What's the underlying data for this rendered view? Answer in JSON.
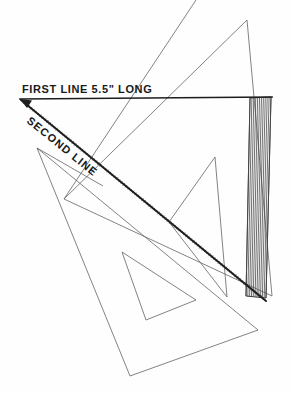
{
  "figure": {
    "medium": "scanned line drawing on white paper",
    "background_color": "#fefefe",
    "ink_color": "#1d1d1d",
    "thin_line_color": "#636363",
    "canvas": {
      "width": 291,
      "height": 393
    }
  },
  "labels": {
    "first_line": {
      "text": "FIRST LINE  5.5\" LONG",
      "x": 22,
      "y": 93,
      "rotation": 0,
      "font_size": 11,
      "letter_spacing": 0.6
    },
    "second_line": {
      "text": "SECOND LINE",
      "x": 26,
      "y": 122,
      "rotation": 39,
      "font_size": 11,
      "letter_spacing": 1.1
    }
  },
  "construction_lines": {
    "first_line": {
      "name": "first-line",
      "from": {
        "x": 20,
        "y": 99
      },
      "to": {
        "x": 272,
        "y": 97
      },
      "stroke_width": 1.7,
      "arrow_at": "start"
    },
    "second_line": {
      "name": "second-line",
      "from": {
        "x": 21,
        "y": 100
      },
      "to": {
        "x": 266,
        "y": 301
      },
      "stroke_width": 2.0,
      "style": "sketched"
    }
  },
  "upper_triangle": {
    "name": "upper-drafting-triangle",
    "outline": [
      {
        "x": 247,
        "y": 20
      },
      {
        "x": 272,
        "y": 296
      },
      {
        "x": 64,
        "y": 199
      }
    ],
    "inner_cutout": [
      {
        "x": 215,
        "y": 157
      },
      {
        "x": 227,
        "y": 297
      },
      {
        "x": 169,
        "y": 222
      }
    ],
    "stroke_width": 0.8
  },
  "lower_triangle": {
    "name": "lower-drafting-triangle",
    "outline": [
      {
        "x": 37,
        "y": 148
      },
      {
        "x": 258,
        "y": 330
      },
      {
        "x": 130,
        "y": 376
      }
    ],
    "inner_cutout": [
      {
        "x": 122,
        "y": 252
      },
      {
        "x": 196,
        "y": 300
      },
      {
        "x": 146,
        "y": 320
      }
    ],
    "stroke_width": 0.8
  },
  "hatched_strip": {
    "name": "section-hatched-strip",
    "description": "narrow vertical band filled with closely spaced hatch lines",
    "outline": [
      {
        "x": 250,
        "y": 98
      },
      {
        "x": 271,
        "y": 97
      },
      {
        "x": 266,
        "y": 298
      },
      {
        "x": 246,
        "y": 296
      }
    ],
    "hatch_spacing": 2.0,
    "hatch_count": 11,
    "hatch_stroke_width": 0.8,
    "hatch_color": "#4a4a4a"
  },
  "extra_edges": [
    {
      "name": "upper-triangle-left-edge-extension",
      "from": {
        "x": 64,
        "y": 199
      },
      "to": {
        "x": 196,
        "y": 0
      }
    },
    {
      "name": "lower-triangle-upper-edge",
      "from": {
        "x": 37,
        "y": 148
      },
      "to": {
        "x": 103,
        "y": 186
      }
    }
  ]
}
